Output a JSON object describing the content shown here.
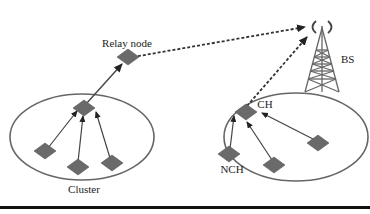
{
  "diagram": {
    "type": "wireless-sensor-network-clustering",
    "labels": {
      "relay_node": "Relay node",
      "base_station": "BS",
      "cluster_head": "CH",
      "non_cluster_head": "NCH",
      "cluster": "Cluster"
    },
    "nodes": [
      {
        "id": "relay",
        "role": "relay node"
      },
      {
        "id": "left-ch",
        "role": "cluster head",
        "cluster": "left"
      },
      {
        "id": "left-n1",
        "role": "member",
        "cluster": "left"
      },
      {
        "id": "left-n2",
        "role": "member",
        "cluster": "left"
      },
      {
        "id": "left-n3",
        "role": "member",
        "cluster": "left"
      },
      {
        "id": "right-ch",
        "role": "cluster head",
        "cluster": "right"
      },
      {
        "id": "right-n1",
        "role": "non cluster head",
        "cluster": "right"
      },
      {
        "id": "right-n2",
        "role": "non cluster head",
        "cluster": "right"
      },
      {
        "id": "right-n3",
        "role": "non cluster head",
        "cluster": "right"
      },
      {
        "id": "bs",
        "role": "base station"
      }
    ],
    "edges": [
      {
        "from": "left-n1",
        "to": "left-ch",
        "style": "solid"
      },
      {
        "from": "left-n2",
        "to": "left-ch",
        "style": "solid"
      },
      {
        "from": "left-n3",
        "to": "left-ch",
        "style": "solid"
      },
      {
        "from": "left-ch",
        "to": "relay",
        "style": "solid"
      },
      {
        "from": "relay",
        "to": "bs",
        "style": "dashed"
      },
      {
        "from": "right-n1",
        "to": "right-ch",
        "style": "solid"
      },
      {
        "from": "right-n2",
        "to": "right-ch",
        "style": "solid"
      },
      {
        "from": "right-n3",
        "to": "right-ch",
        "style": "solid"
      },
      {
        "from": "right-ch",
        "to": "bs",
        "style": "dashed"
      }
    ],
    "colors": {
      "node": "#6a6a6a",
      "ellipse": "#666666",
      "line": "#333333"
    }
  }
}
